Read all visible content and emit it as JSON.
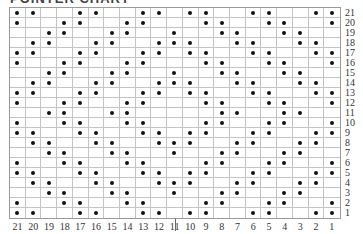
{
  "title": "POINTER CHART",
  "chart_data": {
    "type": "table",
    "title": "POINTER CHART",
    "columns": 21,
    "rows": 21,
    "column_labels": [
      21,
      20,
      19,
      18,
      17,
      16,
      15,
      14,
      13,
      12,
      11,
      10,
      9,
      8,
      7,
      6,
      5,
      4,
      3,
      2,
      1
    ],
    "row_labels": [
      21,
      20,
      19,
      18,
      17,
      16,
      15,
      14,
      13,
      12,
      11,
      10,
      9,
      8,
      7,
      6,
      5,
      4,
      3,
      2,
      1
    ],
    "dots_by_row": {
      "21": [
        21,
        20,
        17,
        16,
        13,
        12,
        10,
        9,
        6,
        5,
        2,
        1
      ],
      "20": [
        21,
        18,
        17,
        14,
        13,
        9,
        8,
        5,
        4,
        1
      ],
      "19": [
        19,
        18,
        15,
        14,
        11,
        8,
        7,
        4,
        3
      ],
      "18": [
        20,
        19,
        16,
        15,
        12,
        11,
        10,
        7,
        6,
        3,
        2
      ],
      "17": [
        21,
        20,
        17,
        16,
        13,
        12,
        10,
        9,
        6,
        5,
        2,
        1
      ],
      "16": [
        21,
        18,
        17,
        14,
        13,
        9,
        8,
        5,
        4,
        1
      ],
      "15": [
        19,
        18,
        15,
        14,
        11,
        8,
        7,
        4,
        3
      ],
      "14": [
        20,
        19,
        16,
        15,
        12,
        11,
        10,
        7,
        6,
        3,
        2
      ],
      "13": [
        21,
        20,
        17,
        16,
        13,
        12,
        10,
        9,
        6,
        5,
        2,
        1
      ],
      "12": [
        21,
        18,
        17,
        14,
        13,
        9,
        8,
        5,
        4,
        1
      ],
      "11": [
        19,
        18,
        15,
        14,
        8,
        7,
        4,
        3
      ],
      "10": [
        21,
        18,
        17,
        14,
        13,
        9,
        8,
        5,
        4,
        1
      ],
      "9": [
        21,
        20,
        17,
        16,
        13,
        12,
        10,
        9,
        6,
        5,
        2,
        1
      ],
      "8": [
        20,
        19,
        16,
        15,
        12,
        11,
        10,
        7,
        6,
        3,
        2
      ],
      "7": [
        19,
        18,
        15,
        14,
        11,
        8,
        7,
        4,
        3
      ],
      "6": [
        21,
        18,
        17,
        14,
        13,
        9,
        8,
        5,
        4,
        1
      ],
      "5": [
        21,
        20,
        17,
        16,
        13,
        12,
        10,
        9,
        6,
        5,
        2,
        1
      ],
      "4": [
        20,
        19,
        16,
        15,
        12,
        11,
        10,
        7,
        6,
        3,
        2
      ],
      "3": [
        19,
        18,
        15,
        14,
        11,
        8,
        7,
        4,
        3
      ],
      "2": [
        21,
        18,
        17,
        14,
        13,
        9,
        8,
        5,
        4,
        1
      ],
      "1": [
        21,
        20,
        17,
        16,
        13,
        12,
        10,
        9,
        6,
        5,
        2,
        1
      ]
    },
    "divider_after_column": 14,
    "grid": true
  }
}
